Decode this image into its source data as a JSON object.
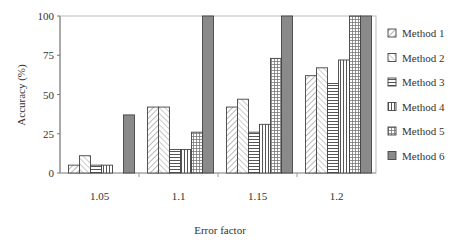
{
  "chart_data": {
    "type": "bar",
    "title": "",
    "xlabel": "Error factor",
    "ylabel": "Accuracy (%)",
    "ylim": [
      0,
      100
    ],
    "yticks": [
      0,
      25,
      50,
      75,
      100
    ],
    "categories": [
      "1.05",
      "1.1",
      "1.15",
      "1.2"
    ],
    "grid": false,
    "legend_position": "right",
    "series": [
      {
        "name": "Method 1",
        "pattern": "diag-right",
        "values": [
          5,
          42,
          42,
          62
        ]
      },
      {
        "name": "Method 2",
        "pattern": "diag-left",
        "values": [
          11,
          42,
          47,
          67
        ]
      },
      {
        "name": "Method 3",
        "pattern": "horizontal",
        "values": [
          5,
          15,
          26,
          57
        ]
      },
      {
        "name": "Method 4",
        "pattern": "vertical",
        "values": [
          5,
          15,
          31,
          72
        ]
      },
      {
        "name": "Method 5",
        "pattern": "grid",
        "values": [
          0,
          26,
          73,
          100
        ]
      },
      {
        "name": "Method 6",
        "pattern": "solid-gray",
        "values": [
          37,
          100,
          100,
          100
        ]
      }
    ]
  }
}
